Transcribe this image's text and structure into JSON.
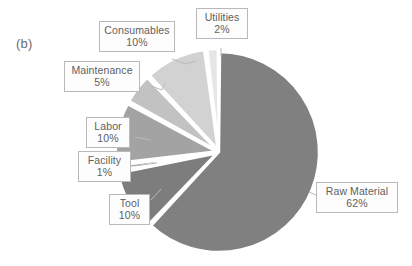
{
  "figure": {
    "panel_label": "(b)",
    "background_color": "#ffffff"
  },
  "chart_data": {
    "type": "pie",
    "title": "",
    "xlabel": "",
    "ylabel": "",
    "legend_position": "none",
    "labels_style": "callout-boxes-with-leader-lines",
    "start_angle_deg": 0,
    "direction": "clockwise",
    "units": "percent",
    "categories": [
      "Raw Material",
      "Tool",
      "Facility",
      "Labor",
      "Maintenance",
      "Consumables",
      "Utilities"
    ],
    "values": [
      62,
      10,
      1,
      10,
      5,
      10,
      2
    ],
    "total": 100,
    "slices": [
      {
        "label": "Raw Material",
        "value": 62,
        "value_text": "62%",
        "color": "#808080",
        "start_deg": 0,
        "end_deg": 223.2
      },
      {
        "label": "Tool",
        "value": 10,
        "value_text": "10%",
        "color": "#7d7d7d",
        "start_deg": 223.2,
        "end_deg": 259.2
      },
      {
        "label": "Facility",
        "value": 1,
        "value_text": "1%",
        "color": "#9a9a9a",
        "start_deg": 259.2,
        "end_deg": 262.8
      },
      {
        "label": "Labor",
        "value": 10,
        "value_text": "10%",
        "color": "#a3a3a3",
        "start_deg": 262.8,
        "end_deg": 298.8
      },
      {
        "label": "Maintenance",
        "value": 5,
        "value_text": "5%",
        "color": "#c2c2c2",
        "start_deg": 298.8,
        "end_deg": 316.8
      },
      {
        "label": "Consumables",
        "value": 10,
        "value_text": "10%",
        "color": "#d2d2d2",
        "start_deg": 316.8,
        "end_deg": 352.8
      },
      {
        "label": "Utilities",
        "value": 2,
        "value_text": "2%",
        "color": "#e6e6e6",
        "start_deg": 352.8,
        "end_deg": 360
      }
    ],
    "callouts": [
      {
        "name": "Utilities",
        "pct": "2%"
      },
      {
        "name": "Consumables",
        "pct": "10%"
      },
      {
        "name": "Maintenance",
        "pct": "5%"
      },
      {
        "name": "Labor",
        "pct": "10%"
      },
      {
        "name": "Facility",
        "pct": "1%"
      },
      {
        "name": "Tool",
        "pct": "10%"
      },
      {
        "name": "Raw Material",
        "pct": "62%"
      }
    ]
  }
}
